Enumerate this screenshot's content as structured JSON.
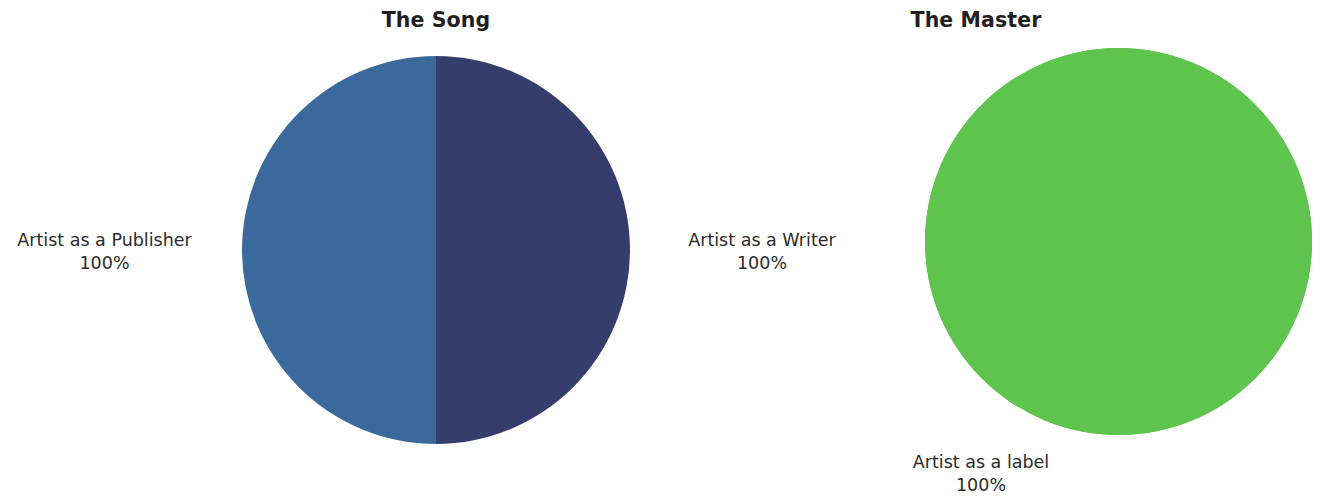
{
  "page": {
    "background": "#ffffff",
    "width": 1322,
    "height": 500
  },
  "charts": [
    {
      "id": "song",
      "title": "The Song",
      "labels": {
        "publisher_name": "Artist as a Publisher",
        "publisher_pct": "100%",
        "writer_name": "Artist as a Writer",
        "writer_pct": "100%"
      }
    },
    {
      "id": "master",
      "title": "The Master",
      "labels": {
        "label_name": "Artist as a label",
        "label_pct": "100%"
      }
    }
  ],
  "chart_data": [
    {
      "type": "pie",
      "title": "The Song",
      "categories": [
        "Artist as a Publisher",
        "Artist as a Writer"
      ],
      "values": [
        50,
        50
      ],
      "value_labels": [
        "100%",
        "100%"
      ],
      "colors": [
        "#3a6a9c",
        "#343d6b"
      ],
      "legend": "none",
      "label_position": "outside",
      "note": "Two equal halves split vertically; each wedge annotated 100% (100% of its own right)."
    },
    {
      "type": "pie",
      "title": "The Master",
      "categories": [
        "Artist as a label"
      ],
      "values": [
        100
      ],
      "value_labels": [
        "100%"
      ],
      "colors": [
        "#5ec44e"
      ],
      "legend": "none",
      "label_position": "outside-bottom",
      "note": "Single full circle representing 100% ownership."
    }
  ],
  "colors": {
    "publisher_blue": "#3a6a9c",
    "writer_navy": "#343d6b",
    "master_green": "#5ec44e",
    "title_text": "#231f20",
    "label_text": "#2b2b2b",
    "background": "#ffffff"
  }
}
